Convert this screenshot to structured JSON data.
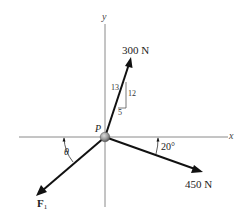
{
  "diagram": {
    "type": "force-diagram",
    "point": {
      "label": "P",
      "x": 105,
      "y": 137
    },
    "axes": {
      "x": {
        "label": "x",
        "from": [
          19,
          137
        ],
        "to": [
          228,
          137
        ]
      },
      "y": {
        "label": "y",
        "from": [
          105,
          24
        ],
        "to": [
          105,
          207
        ]
      }
    },
    "forces": [
      {
        "name": "force-300N",
        "label": "300 N",
        "magnitude": 300,
        "unit": "N",
        "tip": [
          131,
          58
        ],
        "slope_triangle": {
          "hypotenuse": "13",
          "vertical": "12",
          "horizontal": "5"
        }
      },
      {
        "name": "force-450N",
        "label": "450 N",
        "magnitude": 450,
        "unit": "N",
        "tip": [
          202,
          172
        ],
        "angle_label": "20°",
        "angle_deg": 20
      },
      {
        "name": "force-F1",
        "label": "F",
        "subscript": "1",
        "tip": [
          37,
          195
        ],
        "angle_label": "θ"
      }
    ],
    "colors": {
      "force": "#111111",
      "axis": "#8a8a8a",
      "point": "#9a9a9a"
    }
  }
}
